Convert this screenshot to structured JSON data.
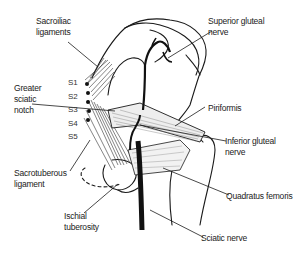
{
  "diagram": {
    "labels": {
      "sacroiliac": [
        "Sacroiliac",
        "ligaments"
      ],
      "superior_gluteal": [
        "Superior gluteal",
        "nerve"
      ],
      "greater_sciatic": [
        "Greater",
        "sciatic",
        "notch"
      ],
      "piriformis": "Piriformis",
      "inferior_gluteal": [
        "Inferior gluteal",
        "nerve"
      ],
      "sacrotuberous": [
        "Sacrotuberous",
        "ligament"
      ],
      "quadratus": "Quadratus femoris",
      "ischial": [
        "Ischial",
        "tuberosity"
      ],
      "sciatic_nerve": "Sciatic nerve"
    },
    "sacral_levels": [
      "S1",
      "S2",
      "S3",
      "S4",
      "S5"
    ],
    "colors": {
      "line": "#1a1a1a",
      "text": "#222222",
      "background": "#ffffff"
    }
  }
}
